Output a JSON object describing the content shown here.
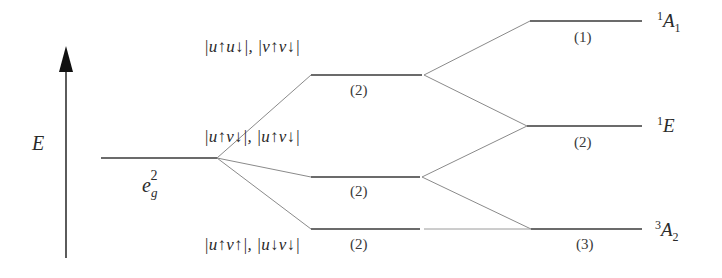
{
  "axis": {
    "label": "E"
  },
  "config": {
    "base": "e",
    "sub": "g",
    "sup": "2"
  },
  "kets": [
    {
      "text": "|u↑u↓|, |v↑v↓|"
    },
    {
      "text": "|u↑v↓|, |u↑v↓|"
    },
    {
      "text": "|u↑v↑|, |u↓v↓|"
    }
  ],
  "middle_levels": [
    {
      "degeneracy": "(2)"
    },
    {
      "degeneracy": "(2)"
    },
    {
      "degeneracy": "(2)"
    }
  ],
  "terms": [
    {
      "mult": "1",
      "letter": "A",
      "sub": "1",
      "degeneracy": "(1)"
    },
    {
      "mult": "1",
      "letter": "E",
      "sub": "",
      "degeneracy": "(2)"
    },
    {
      "mult": "3",
      "letter": "A",
      "sub": "2",
      "degeneracy": "(3)"
    }
  ],
  "colors": {
    "line": "#3a3a3a",
    "connector": "#8a8a8a",
    "arrow": "#111111"
  }
}
